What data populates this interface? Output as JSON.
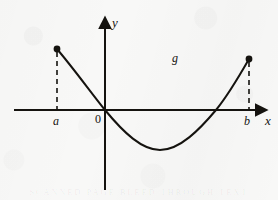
{
  "figure": {
    "background_color": "#f8f8f7",
    "ink_color": "#15130f",
    "ghost_text": "SCANNED PAGE BLEED THROUGH TEXT"
  },
  "axes": {
    "x_axis": {
      "label": "x",
      "origin_label": "0",
      "start_px": [
        14,
        110
      ],
      "end_px": [
        262,
        110
      ],
      "arrow": "right"
    },
    "y_axis": {
      "label": "y",
      "start_px": [
        105,
        190
      ],
      "end_px": [
        105,
        22
      ],
      "arrow": "up"
    }
  },
  "markers": {
    "left_endpoint": {
      "label": "a",
      "point_px": [
        57,
        49
      ],
      "foot_px": [
        57,
        110
      ],
      "dot": "filled",
      "guide": "dashed"
    },
    "right_endpoint": {
      "label": "b",
      "point_px": [
        249,
        59
      ],
      "foot_px": [
        249,
        110
      ],
      "dot": "filled",
      "guide": "dashed"
    }
  },
  "curve": {
    "label": "g",
    "label_px": [
      172,
      52
    ],
    "stroke_width": 2,
    "path": "M 57 49 C 74 69, 92 94, 105 110 C 124 133, 142 150, 160 150 C 180 150, 200 129, 216 110 C 229 94, 241 73, 249 59",
    "key_points_px": [
      [
        57,
        49
      ],
      [
        105,
        110
      ],
      [
        160,
        150
      ],
      [
        216,
        110
      ],
      [
        249,
        59
      ]
    ]
  },
  "chart_data": {
    "type": "line",
    "xlabel": "x",
    "ylabel": "y",
    "grid": false,
    "legend": null,
    "annotations": [
      "g",
      "a",
      "b",
      "0"
    ],
    "xticks": [
      "a",
      "0",
      "b"
    ],
    "yticks": [],
    "domain": [
      "a",
      "b"
    ],
    "series": [
      {
        "name": "g",
        "description": "Parabola-like curve, positive at x=a, decreasing through the origin, minimum between 0 and b, increasing to positive at x=b",
        "x": [
          "a",
          0,
          "vertex",
          "root2",
          "b"
        ],
        "y": [
          "positive",
          0,
          "minimum",
          0,
          "positive"
        ],
        "endpoints_marked": true
      }
    ],
    "zeros": [
      0,
      "root2"
    ],
    "minimum": {
      "x": "between 0 and b",
      "y": "negative"
    }
  }
}
